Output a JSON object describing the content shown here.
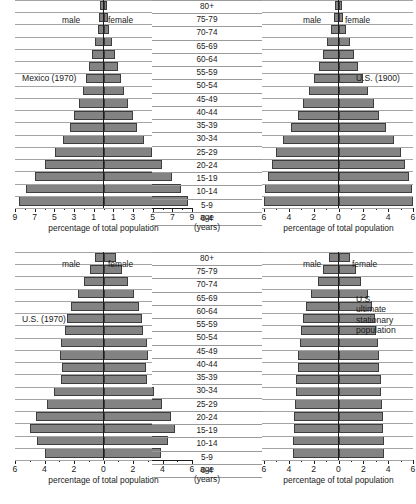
{
  "common": {
    "male_label": "male",
    "female_label": "female",
    "axis_caption": "percentage of total population",
    "age_caption_line1": "age",
    "age_caption_line2": "(years)",
    "bar_color": "#838383",
    "bar_border_color": "#3d3d3d",
    "axis_color": "#1c1c1c",
    "background": "#ffffff",
    "age_groups": [
      "80+",
      "75-79",
      "70-74",
      "65-69",
      "60-64",
      "55-59",
      "50-54",
      "45-49",
      "40-44",
      "35-39",
      "30-34",
      "25-29",
      "20-24",
      "15-19",
      "10-14",
      "5-9",
      "0-4"
    ]
  },
  "chart_data": [
    {
      "type": "bar",
      "id": "mexico-1970",
      "title": "Mexico (1970)",
      "label_position": "left",
      "xlabel": "percentage of total population",
      "ylabel": "age (years)",
      "categories": [
        "80+",
        "75-79",
        "70-74",
        "65-69",
        "60-64",
        "55-59",
        "50-54",
        "45-49",
        "40-44",
        "35-39",
        "30-34",
        "25-29",
        "20-24",
        "15-19",
        "10-14",
        "5-9",
        "0-4"
      ],
      "xlim": [
        0,
        9
      ],
      "xticks": [
        9,
        7,
        5,
        3,
        1,
        1,
        3,
        5,
        7,
        9
      ],
      "xtick_labels": [
        "9",
        "7",
        "5",
        "3",
        "1",
        "1",
        "3",
        "5",
        "7",
        "9"
      ],
      "grid": true,
      "legend": [
        "male",
        "female"
      ],
      "series": [
        {
          "name": "male",
          "values": [
            0.35,
            0.45,
            0.6,
            0.9,
            1.2,
            1.5,
            1.8,
            2.1,
            2.5,
            3.0,
            3.4,
            4.1,
            4.9,
            5.9,
            7.0,
            7.9,
            8.6
          ]
        },
        {
          "name": "female",
          "values": [
            0.35,
            0.45,
            0.6,
            0.9,
            1.2,
            1.5,
            1.8,
            2.1,
            2.5,
            3.0,
            3.4,
            4.1,
            4.9,
            5.9,
            7.0,
            7.9,
            8.6
          ]
        }
      ]
    },
    {
      "type": "bar",
      "id": "us-1900",
      "title": "U.S. (1900)",
      "label_position": "right",
      "xlabel": "percentage of total population",
      "ylabel": "age (years)",
      "categories": [
        "80+",
        "75-79",
        "70-74",
        "65-69",
        "60-64",
        "55-59",
        "50-54",
        "45-49",
        "40-44",
        "35-39",
        "30-34",
        "25-29",
        "20-24",
        "15-19",
        "10-14",
        "5-9",
        "0-4"
      ],
      "xlim": [
        0,
        6
      ],
      "xticks": [
        6,
        4,
        2,
        0,
        2,
        4,
        6
      ],
      "xtick_labels": [
        "6",
        "4",
        "2",
        "0",
        "2",
        "4",
        "6"
      ],
      "grid": true,
      "legend": [
        "male",
        "female"
      ],
      "series": [
        {
          "name": "male",
          "values": [
            0.25,
            0.4,
            0.6,
            0.9,
            1.25,
            1.6,
            2.0,
            2.4,
            2.85,
            3.3,
            3.85,
            4.5,
            5.0,
            5.35,
            5.65,
            5.9,
            6.0
          ]
        },
        {
          "name": "female",
          "values": [
            0.25,
            0.4,
            0.6,
            0.9,
            1.25,
            1.6,
            2.0,
            2.4,
            2.85,
            3.3,
            3.85,
            4.5,
            5.0,
            5.35,
            5.65,
            5.9,
            6.0
          ]
        }
      ]
    },
    {
      "type": "bar",
      "id": "us-1970",
      "title": "U.S. (1970)",
      "label_position": "left",
      "xlabel": "percentage of total population",
      "ylabel": "age (years)",
      "categories": [
        "80+",
        "75-79",
        "70-74",
        "65-69",
        "60-64",
        "55-59",
        "50-54",
        "45-49",
        "40-44",
        "35-39",
        "30-34",
        "25-29",
        "20-24",
        "15-19",
        "10-14",
        "5-9",
        "0-4"
      ],
      "xlim": [
        0,
        6
      ],
      "xticks": [
        6,
        4,
        2,
        0,
        2,
        4,
        6
      ],
      "xtick_labels": [
        "6",
        "4",
        "2",
        "0",
        "2",
        "4",
        "6"
      ],
      "grid": true,
      "legend": [
        "male",
        "female"
      ],
      "series": [
        {
          "name": "male",
          "values": [
            0.55,
            0.95,
            1.35,
            1.75,
            2.2,
            2.5,
            2.6,
            2.9,
            2.95,
            2.8,
            2.9,
            3.35,
            3.85,
            4.6,
            5.0,
            4.5,
            4.0
          ]
        },
        {
          "name": "female",
          "values": [
            0.85,
            1.25,
            1.65,
            2.05,
            2.4,
            2.6,
            2.7,
            2.95,
            3.0,
            2.85,
            2.95,
            3.4,
            3.95,
            4.6,
            4.85,
            4.4,
            3.9
          ]
        }
      ]
    },
    {
      "type": "bar",
      "id": "us-ultimate-stationary",
      "title": "U.S. ultimate stationary population",
      "title_lines": [
        "U.S.",
        "ultimate",
        "stationary",
        "population"
      ],
      "label_position": "right",
      "xlabel": "percentage of total population",
      "ylabel": "age (years)",
      "categories": [
        "80+",
        "75-79",
        "70-74",
        "65-69",
        "60-64",
        "55-59",
        "50-54",
        "45-49",
        "40-44",
        "35-39",
        "30-34",
        "25-29",
        "20-24",
        "15-19",
        "10-14",
        "5-9",
        "0-4"
      ],
      "xlim": [
        0,
        6
      ],
      "xticks": [
        6,
        4,
        2,
        0,
        2,
        4,
        6
      ],
      "xtick_labels": [
        "6",
        "4",
        "2",
        "0",
        "2",
        "4",
        "6"
      ],
      "grid": true,
      "legend": [
        "male",
        "female"
      ],
      "series": [
        {
          "name": "male",
          "values": [
            0.75,
            1.25,
            1.65,
            2.25,
            2.6,
            2.85,
            3.0,
            3.1,
            3.25,
            3.3,
            3.4,
            3.45,
            3.5,
            3.55,
            3.6,
            3.65,
            3.7
          ]
        },
        {
          "name": "female",
          "values": [
            0.95,
            1.4,
            1.8,
            2.35,
            2.7,
            2.95,
            3.05,
            3.15,
            3.25,
            3.3,
            3.4,
            3.45,
            3.5,
            3.55,
            3.6,
            3.65,
            3.7
          ]
        }
      ]
    }
  ]
}
